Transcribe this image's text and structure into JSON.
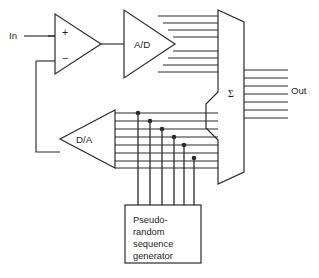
{
  "figure": {
    "background_color": "#ffffff",
    "line_color": "#2b2b2b"
  },
  "labels": {
    "input": "In",
    "output": "Out",
    "adc": "A/D",
    "dac": "D/A",
    "summer": "Σ",
    "plus_input": "+",
    "minus_input": "−"
  },
  "prs_generator": {
    "lines": [
      "Pseudo-",
      "random",
      "sequence",
      "generator"
    ]
  },
  "buses": {
    "adc_output_bus": {
      "line_count": 8,
      "label": "A/D output bus"
    },
    "dac_input_bus": {
      "line_count": 8,
      "label": "D/A feedback bus"
    },
    "output_bus": {
      "line_count": 7,
      "label": "Out bus"
    },
    "prs_bus": {
      "line_count": 6,
      "label": "Pseudo-random sequence tap bus"
    }
  },
  "nodes": {
    "tap_dot_count": 6,
    "description": "Staircase connection dots joining pseudo-random sequence lines to D/A feedback bus"
  }
}
